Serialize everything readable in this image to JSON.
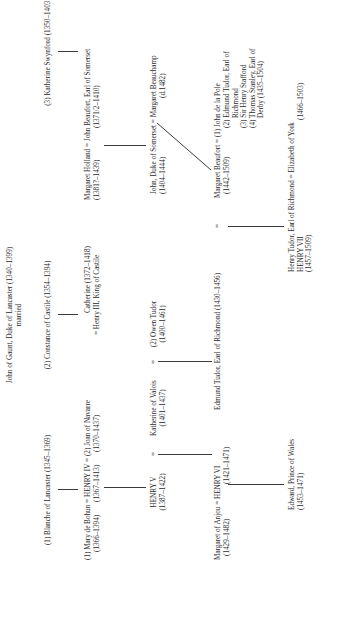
{
  "title": {
    "line1": "John of Gaunt, Duke of Lancaster (1340–1399)",
    "line2": "married"
  },
  "wives": [
    {
      "label": "(1) Blanche of Lancaster (1345–1369)"
    },
    {
      "label": "(2) Constance of Castile (1354–1394)"
    },
    {
      "label": "(3) Katherine Swynford (1350–1403)"
    }
  ],
  "henry_iv_family": {
    "wife1": "(1) Mary de Bohun",
    "eq1": "=",
    "king": "HENRY IV",
    "eq2": "=",
    "wife2": "(2) Joan of Navarre",
    "wife1_dates": "(1366–1394)",
    "king_dates": "(1367–1413)",
    "wife2_dates": "(1370–1437)"
  },
  "catherine": {
    "name": "Catherine (1372–1418)",
    "spouse": "= Henry III, King of Castile"
  },
  "beaufort_earl": {
    "wife": "Margaret Holland",
    "eq": "=",
    "husband": "John Beaufort, Earl of Somerset",
    "wife_dates": "(1381?–1439)",
    "husband_dates": "(1371/2–1410)"
  },
  "henry_v_family": {
    "king": "HENRY V",
    "king_dates": "(1387–1422)",
    "eq1": "=",
    "queen": "Katherine of Valois",
    "queen_dates": "(1401–1437)",
    "eq2": "=",
    "second": "(2) Owen Tudor",
    "second_dates": "(1400–1461)"
  },
  "somerset_duke": {
    "husband": "John, Duke of Somerset",
    "eq": "=",
    "wife": "Margaret Beauchamp",
    "husband_dates": "(1404–1444)",
    "wife_dates": "(d.1482)"
  },
  "henry_vi_family": {
    "queen": "Margaret of Anjou",
    "eq": "=",
    "king": "HENRY VI",
    "queen_dates": "(1429–1482)",
    "king_dates": "(1421–1471)"
  },
  "edmund_tudor": {
    "name": "Edmund Tudor, Earl of Richmond (1430–1456)",
    "eq": "="
  },
  "margaret_beaufort": {
    "name": "Margaret Beaufort",
    "eq": "=",
    "dates": "(1442–1509)",
    "husbands": [
      "(1) John de la Pole",
      "(2) Edmund Tudor, Earl of",
      "Richmond",
      "(3) Sir Henry Stafford",
      "(4) Thomas Stanley, Earl of",
      "Derby (1435–1504)"
    ]
  },
  "edward_prince": {
    "name": "Edward, Prince of Wales",
    "dates": "(1453–1471)"
  },
  "henry_vii": {
    "name": "Henry Tudor, Earl of Richmond",
    "eq": "=",
    "spouse": "Elizabeth of York",
    "title": "HENRY VII",
    "dates": "(1457–1509)",
    "spouse_dates": "(1466–1503)"
  }
}
